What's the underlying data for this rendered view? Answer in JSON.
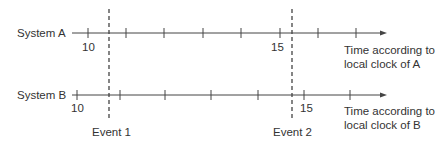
{
  "diagram": {
    "colors": {
      "line": "#444444",
      "text": "#333333",
      "background": "#ffffff"
    },
    "timelines": [
      {
        "name": "System A",
        "axis_label_line1": "Time according to",
        "axis_label_line2": "local clock of A",
        "tick_labels": [
          {
            "text": "10",
            "tick_index": 0
          },
          {
            "text": "15",
            "tick_index": 5
          }
        ],
        "tick_count": 8
      },
      {
        "name": "System B",
        "axis_label_line1": "Time according to",
        "axis_label_line2": "local clock of B",
        "tick_labels": [
          {
            "text": "10",
            "tick_index": 0
          },
          {
            "text": "15",
            "tick_index": 5
          }
        ],
        "tick_count": 7
      }
    ],
    "events": [
      {
        "label": "Event 1"
      },
      {
        "label": "Event 2"
      }
    ]
  }
}
